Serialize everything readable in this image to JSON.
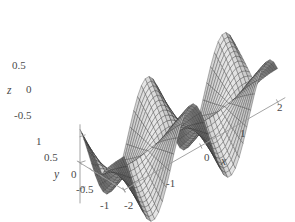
{
  "figure": {
    "type": "surface-plot-3d",
    "background_color": "#ffffff",
    "axis_color": "#9a9a9a",
    "mesh_line_color": "#2b2b2b",
    "surface_light_color": "#e8e8e8",
    "surface_dark_color": "#4f4f4f",
    "label_color": "#4a4a4a"
  },
  "axes": {
    "x": {
      "title": "x",
      "ticks": [
        "-2",
        "-1",
        "0",
        "1",
        "2"
      ],
      "range": [
        -2,
        2
      ]
    },
    "y": {
      "title": "y",
      "ticks": [
        "1",
        "0.5",
        "0",
        "-0.5",
        "-1"
      ],
      "range": [
        -1,
        1
      ]
    },
    "z": {
      "title": "z",
      "ticks": [
        "0.5",
        "0",
        "-0.5"
      ],
      "range": [
        -0.5,
        0.5
      ]
    }
  },
  "chart_data": {
    "type": "surface",
    "title": "",
    "xlabel": "x",
    "ylabel": "y",
    "zlabel": "z",
    "xlim": [
      -2,
      2
    ],
    "ylim": [
      -1,
      1
    ],
    "zlim": [
      -0.75,
      0.85
    ],
    "x_ticks": [
      -2,
      -1,
      0,
      1,
      2
    ],
    "y_ticks": [
      -1,
      -0.5,
      0,
      0.5,
      1
    ],
    "z_ticks": [
      -0.5,
      0,
      0.5
    ],
    "grid": false,
    "legend": "none",
    "mesh_nx": 40,
    "mesh_ny": 22,
    "view_azimuth_deg": -58,
    "view_elevation_deg": 22,
    "surface_formula": "z = sin(pi*x)*|y| shaped periodic saddle with sharp ridges"
  },
  "labels": {
    "z_05": "0.5",
    "z_0": "0",
    "z_m05": "-0.5",
    "z_title": "z",
    "y_1": "1",
    "y_05": "0.5",
    "y_0": "0",
    "y_m05": "-0.5",
    "y_m1": "-1",
    "y_title": "y",
    "x_m2": "-2",
    "x_m1": "-1",
    "x_0": "0",
    "x_1": "1",
    "x_2": "2",
    "x_title": "x"
  }
}
